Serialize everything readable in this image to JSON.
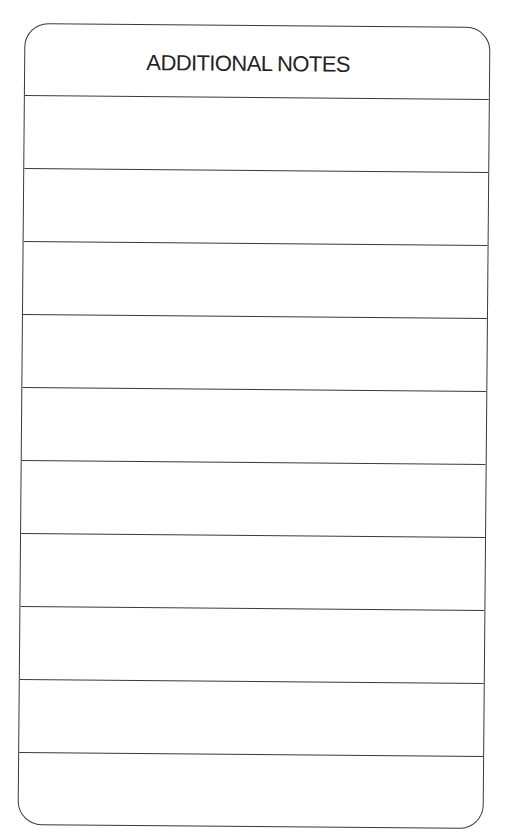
{
  "card": {
    "title": "ADDITIONAL NOTES",
    "border_color": "#3a3a3a",
    "rows": [
      {
        "value": ""
      },
      {
        "value": ""
      },
      {
        "value": ""
      },
      {
        "value": ""
      },
      {
        "value": ""
      },
      {
        "value": ""
      },
      {
        "value": ""
      },
      {
        "value": ""
      },
      {
        "value": ""
      },
      {
        "value": ""
      }
    ]
  }
}
